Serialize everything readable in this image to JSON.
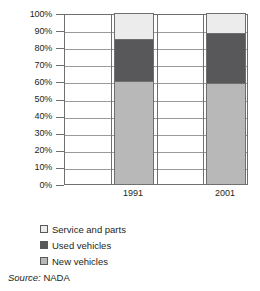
{
  "chart_data": {
    "type": "bar",
    "subtype": "stacked-100-percent",
    "title": "",
    "subtitle": "",
    "xlabel": "",
    "ylabel": "",
    "categories": [
      "1991",
      "2001"
    ],
    "series": [
      {
        "name": "New vehicles",
        "values": [
          60.5,
          59.0
        ],
        "color": "#b8b8b8"
      },
      {
        "name": "Used vehicles",
        "values": [
          24.5,
          29.5
        ],
        "color": "#58585a"
      },
      {
        "name": "Service and parts",
        "values": [
          15.0,
          11.5
        ],
        "color": "#ececec"
      }
    ],
    "stack_order_bottom_to_top": [
      "New vehicles",
      "Used vehicles",
      "Service and parts"
    ],
    "cumulative_tops": {
      "1991": {
        "new_vehicles": 60.5,
        "used_vehicles": 85.0,
        "service_and_parts": 100.0
      },
      "2001": {
        "new_vehicles": 59.0,
        "used_vehicles": 88.5,
        "service_and_parts": 100.0
      }
    },
    "ylim": [
      0,
      100
    ],
    "ytick_step": 10,
    "ytick_labels": [
      "0%",
      "10%",
      "20%",
      "30%",
      "40%",
      "50%",
      "60%",
      "70%",
      "80%",
      "90%",
      "100%"
    ],
    "ytick_values": [
      0,
      10,
      20,
      30,
      40,
      50,
      60,
      70,
      80,
      90,
      100
    ],
    "grid": true,
    "grid_axis": "both",
    "legend_position": "below-left",
    "annotations": []
  },
  "legend": {
    "items": [
      {
        "label": "Service and parts",
        "color": "#ececec"
      },
      {
        "label": "Used vehicles",
        "color": "#58585a"
      },
      {
        "label": "New vehicles",
        "color": "#b8b8b8"
      }
    ]
  },
  "source": {
    "prefix": "Source:",
    "value": "NADA"
  },
  "colors": {
    "new_vehicles": "#b8b8b8",
    "used_vehicles": "#58585a",
    "service_and_parts": "#ececec",
    "axis": "#6f6f6f",
    "gridline": "#9a9a9a",
    "text": "#231f20"
  }
}
